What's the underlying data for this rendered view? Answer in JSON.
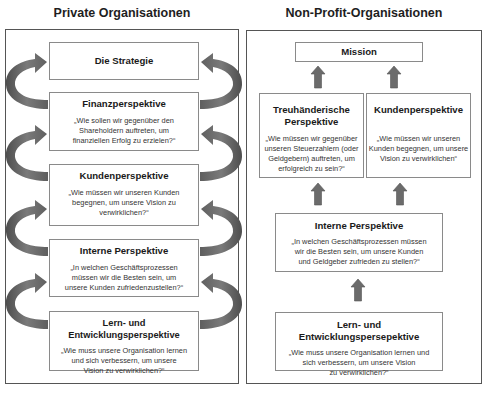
{
  "left": {
    "title": "Private Organisationen",
    "boxes": [
      {
        "heading": "Die Strategie",
        "question": ""
      },
      {
        "heading": "Finanzperspektive",
        "question": "„Wie sollen wir gegenüber den\nShareholdern auftreten, um\nfinanziellen Erfolg zu erzielen?“"
      },
      {
        "heading": "Kundenperspektive",
        "question": "„Wie müssen wir unseren Kunden\nbegegnen, um unsere Vision zu\nverwirklichen?“"
      },
      {
        "heading": "Interne Perspektive",
        "question": "„In welchen Geschäftsprozessen\nmüssen wir die Besten sein, um\nunsere Kunden zufriedenzustellen?“"
      },
      {
        "heading": "Lern- und Entwicklungsperspektive",
        "question": "„Wie muss unsere Organisation lernen\nund sich verbessern, um unsere\nVision zu verwirklichen?“"
      }
    ],
    "arrows": "curved-cycle-arrows"
  },
  "right": {
    "title": "Non-Profit-Organisationen",
    "boxes": {
      "mission": {
        "heading": "Mission"
      },
      "treuhaenderisch": {
        "heading": "Treuhänderische\nPerspektive",
        "question": "„Wie müssen wir gegenüber\nunseren Steuerzahlern (oder\nGeldgebern) auftreten, um\nerfolgreich zu sein?“"
      },
      "kunden": {
        "heading": "Kundenperspektive",
        "question": "„Wie müssen wir unseren\nKunden begegnen, um unsere\nVision zu verwirklichen“"
      },
      "intern": {
        "heading": "Interne Perspektive",
        "question": "„In welchen Geschäftsprozessen müssen\nwir die Besten sein, um unsere Kunden\nund Geldgeber zufrieden zu stellen?“"
      },
      "lern": {
        "heading": "Lern- und Entwicklungspersepektive",
        "question": "„Wie muss unsere Organisation lernen und\nsich verbessern, um unsere Vision\nzu verwirklichen?“"
      }
    },
    "arrows": "straight-up-arrows"
  },
  "colors": {
    "arrow": "#6b6b6b",
    "border": "#555555",
    "box_border": "#8a8a8a"
  }
}
